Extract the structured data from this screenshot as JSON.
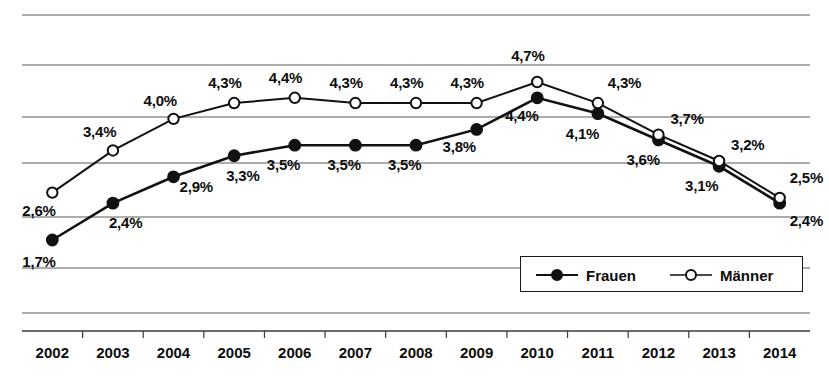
{
  "chart_data": {
    "type": "line",
    "title": "",
    "xlabel": "",
    "ylabel": "",
    "grid": true,
    "legend_position": "bottom-right",
    "ylim": [
      1.0,
      7.0
    ],
    "gridline_values": [
      7.0,
      6.0,
      5.0,
      4.0,
      3.0,
      2.0,
      1.0
    ],
    "categories": [
      "2002",
      "2003",
      "2004",
      "2005",
      "2006",
      "2007",
      "2008",
      "2009",
      "2010",
      "2011",
      "2012",
      "2013",
      "2014"
    ],
    "series": [
      {
        "name": "Frauen",
        "marker": "filled-circle",
        "color": "#111111",
        "values": [
          1.7,
          2.4,
          2.9,
          3.3,
          3.5,
          3.5,
          3.5,
          3.8,
          4.4,
          4.1,
          3.6,
          3.1,
          2.4
        ],
        "labels": [
          "1,7%",
          "2,4%",
          "2,9%",
          "3,3%",
          "3,5%",
          "3,5%",
          "3,5%",
          "3,8%",
          "4,4%",
          "4,1%",
          "3,6%",
          "3,1%",
          "2,4%"
        ]
      },
      {
        "name": "Männer",
        "marker": "open-circle",
        "color": "#111111",
        "values": [
          2.6,
          3.4,
          4.0,
          4.3,
          4.4,
          4.3,
          4.3,
          4.3,
          4.7,
          4.3,
          3.7,
          3.2,
          2.5
        ],
        "labels": [
          "2,6%",
          "3,4%",
          "4,0%",
          "4,3%",
          "4,4%",
          "4,3%",
          "4,3%",
          "4,3%",
          "4,7%",
          "4,3%",
          "3,7%",
          "3,2%",
          "2,5%"
        ]
      }
    ]
  },
  "axis": {
    "tick_labels": [
      "2002",
      "2003",
      "2004",
      "2005",
      "2006",
      "2007",
      "2008",
      "2009",
      "2010",
      "2011",
      "2012",
      "2013",
      "2014"
    ]
  },
  "legend": {
    "entries": [
      {
        "label": "Frauen",
        "marker": "filled-circle"
      },
      {
        "label": "Männer",
        "marker": "open-circle"
      }
    ]
  },
  "value_labels": {
    "frauen": [
      "1,7%",
      "2,4%",
      "2,9%",
      "3,3%",
      "3,5%",
      "3,5%",
      "3,5%",
      "3,8%",
      "4,4%",
      "4,1%",
      "3,6%",
      "3,1%",
      "2,4%"
    ],
    "maenner": [
      "2,6%",
      "3,4%",
      "4,0%",
      "4,3%",
      "4,4%",
      "4,3%",
      "4,3%",
      "4,3%",
      "4,7%",
      "4,3%",
      "3,7%",
      "3,2%",
      "2,5%"
    ]
  }
}
